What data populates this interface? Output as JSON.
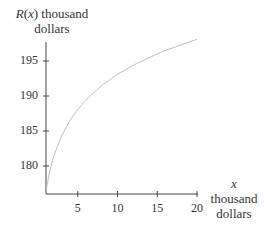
{
  "chart_data": {
    "type": "line",
    "title": "",
    "ylabel_lines": [
      "R(x) thousand",
      "dollars"
    ],
    "ylabel_func": "R",
    "ylabel_arg": "x",
    "xlabel_lines": [
      "x",
      "thousand",
      "dollars"
    ],
    "xlim": [
      1,
      20
    ],
    "ylim": [
      176,
      198
    ],
    "x_ticks": [
      5,
      10,
      15,
      20
    ],
    "y_ticks": [
      180,
      185,
      190,
      195
    ],
    "grid": false,
    "legend": "none",
    "series": [
      {
        "name": "R(x)",
        "color": "#bbbbbb",
        "x": [
          1,
          1.5,
          2,
          3,
          4,
          5,
          6,
          8,
          10,
          12,
          14,
          16,
          18,
          20
        ],
        "values": [
          176.5,
          179.4,
          181.5,
          184.4,
          186.5,
          188.1,
          189.4,
          191.5,
          193.1,
          194.4,
          195.5,
          196.5,
          197.3,
          198.1
        ]
      }
    ],
    "axis_color": "#444444"
  }
}
